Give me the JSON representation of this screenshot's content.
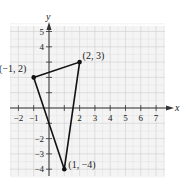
{
  "chart_data": {
    "type": "scatter",
    "title": "",
    "xlabel": "x",
    "ylabel": "y",
    "xlim": [
      -2.5,
      7.5
    ],
    "ylim": [
      -4.5,
      5.5
    ],
    "grid": true,
    "x_ticks": [
      "-2",
      "-1",
      "2",
      "3",
      "4",
      "5",
      "6",
      "7"
    ],
    "y_ticks": [
      "5",
      "4",
      "-2",
      "-3",
      "-4"
    ],
    "x_tick_values": [
      -2,
      -1,
      2,
      3,
      4,
      5,
      6,
      7
    ],
    "y_tick_values": [
      5,
      4,
      -2,
      -3,
      -4
    ],
    "points": [
      {
        "x": -1,
        "y": 2,
        "label": "(−1, 2)"
      },
      {
        "x": 2,
        "y": 3,
        "label": "(2, 3)"
      },
      {
        "x": 1,
        "y": -4,
        "label": "(1, −4)"
      }
    ],
    "shape": "triangle",
    "colors": {
      "grid": "#d9d9d9",
      "grid_bg": "#f3f3f3",
      "axis": "#333333",
      "triangle": "#111111"
    }
  }
}
